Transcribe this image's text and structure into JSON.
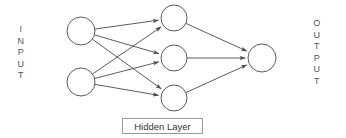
{
  "diagram": {
    "type": "feedforward-neural-network",
    "background_color": "#ffffff",
    "stroke_color": "#4a4a4a",
    "node_fill_color": "#ffffff"
  },
  "labels": {
    "input": "INPUT",
    "output": "OUTPUT",
    "hidden_layer": "Hidden Layer"
  },
  "layers": [
    {
      "name": "input",
      "label": "INPUT",
      "node_count": 2,
      "nodes": [
        {
          "id": "i1",
          "cx": 81,
          "cy": 31,
          "r": 14
        },
        {
          "id": "i2",
          "cx": 81,
          "cy": 82,
          "r": 14
        }
      ]
    },
    {
      "name": "hidden",
      "label": "Hidden Layer",
      "node_count": 3,
      "nodes": [
        {
          "id": "h1",
          "cx": 174,
          "cy": 18,
          "r": 13
        },
        {
          "id": "h2",
          "cx": 174,
          "cy": 58,
          "r": 13
        },
        {
          "id": "h3",
          "cx": 174,
          "cy": 98,
          "r": 13
        }
      ]
    },
    {
      "name": "output",
      "label": "OUTPUT",
      "node_count": 1,
      "nodes": [
        {
          "id": "o1",
          "cx": 262,
          "cy": 58,
          "r": 14
        }
      ]
    }
  ],
  "edges": [
    {
      "from": "i1",
      "to": "h1",
      "directed": true
    },
    {
      "from": "i1",
      "to": "h2",
      "directed": true
    },
    {
      "from": "i1",
      "to": "h3",
      "directed": true
    },
    {
      "from": "i2",
      "to": "h1",
      "directed": true
    },
    {
      "from": "i2",
      "to": "h2",
      "directed": true
    },
    {
      "from": "i2",
      "to": "h3",
      "directed": true
    },
    {
      "from": "h1",
      "to": "o1",
      "directed": true
    },
    {
      "from": "h2",
      "to": "o1",
      "directed": true
    },
    {
      "from": "h3",
      "to": "o1",
      "directed": true
    }
  ]
}
